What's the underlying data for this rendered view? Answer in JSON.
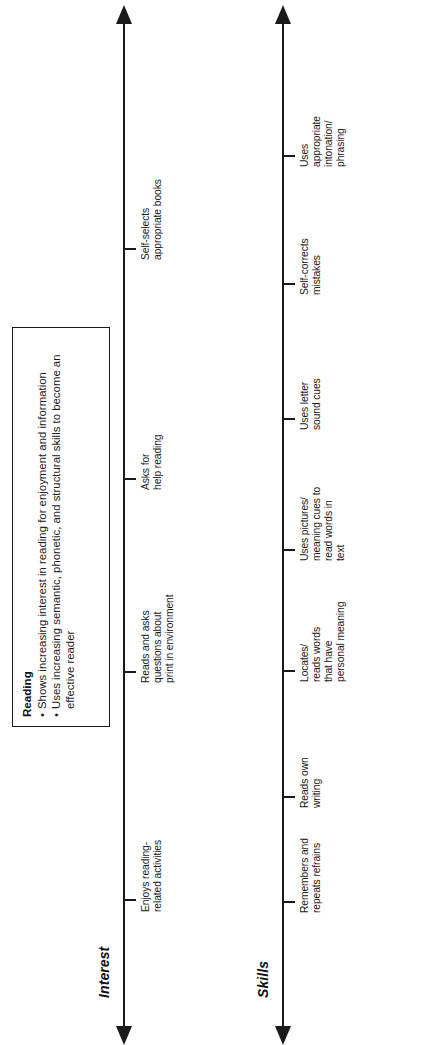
{
  "document": {
    "type": "developmental-continuum-diagram",
    "orientation": "rotated-90-counterclockwise"
  },
  "description_box": {
    "title": "Reading",
    "bullet_marker": "•",
    "bullets": [
      "Shows increasing interest in reading for enjoyment and information",
      "Uses increasing semantic, phonetic, and structural skills to become an effective reader"
    ]
  },
  "axes": [
    {
      "id": "interest",
      "title": "Interest",
      "ticks": [
        {
          "label": "Enjoys reading-\nrelated activities"
        },
        {
          "label": "Reads and asks\nquestions about\nprint in environment"
        },
        {
          "label": "Asks for\nhelp reading"
        },
        {
          "label": "Self-selects\nappropriate books"
        }
      ]
    },
    {
      "id": "skills",
      "title": "Skills",
      "ticks": [
        {
          "label": "Remembers and\nrepeats refrains"
        },
        {
          "label": "Reads own\nwriting"
        },
        {
          "label": "Locates/\nreads words\nthat have\npersonal meaning"
        },
        {
          "label": "Uses pictures/\nmeaning cues to\nread words in\ntext"
        },
        {
          "label": "Uses letter\nsound cues"
        },
        {
          "label": "Self-corrects\nmistakes"
        },
        {
          "label": "Uses\nappropriate\nintonation/\nphrasing"
        }
      ]
    }
  ],
  "colors": {
    "ink": "#1a1a1a",
    "background": "#ffffff"
  }
}
